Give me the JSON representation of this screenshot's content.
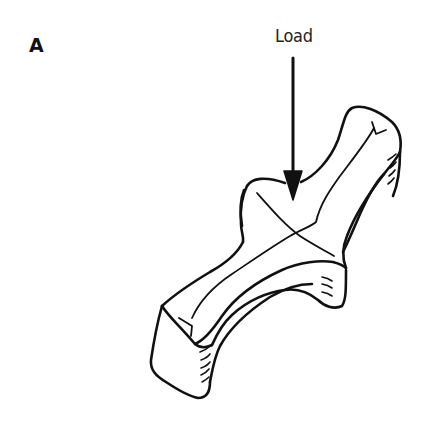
{
  "figure": {
    "panel_label": "A",
    "annotations": {
      "load_label": "Load"
    },
    "elements": {
      "load_arrow": "downward arrow indicating applied load at center of cross-shaped block",
      "specimen": "cross-shaped curved bar / block drawn in isometric line art with hatching on end faces"
    },
    "colors": {
      "stroke": "#111111",
      "background": "#ffffff"
    }
  }
}
